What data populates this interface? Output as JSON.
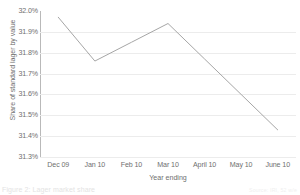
{
  "chart_data": {
    "type": "line",
    "title": "",
    "xlabel": "Year ending",
    "ylabel": "Share of standard lager by value",
    "categories": [
      "Dec 09",
      "Jan 10",
      "Feb 10",
      "Mar 10",
      "April 10",
      "May 10",
      "June 10"
    ],
    "values": [
      31.97,
      31.76,
      31.85,
      31.94,
      31.77,
      31.6,
      31.43
    ],
    "ytick_labels": [
      "32.0%",
      "31.9%",
      "31.8%",
      "31.7%",
      "31.6%",
      "31.5%",
      "31.4%",
      "31.3%"
    ],
    "ytick_values": [
      32.0,
      31.9,
      31.8,
      31.7,
      31.6,
      31.5,
      31.4,
      31.3
    ],
    "ylim": [
      31.3,
      32.0
    ],
    "grid": "horizontal",
    "legend": "none",
    "series": [
      {
        "name": "Share of standard lager by value",
        "values": [
          31.97,
          31.76,
          31.85,
          31.94,
          31.77,
          31.6,
          31.43
        ],
        "color": "#a6a6a6"
      }
    ],
    "line_color": "#a6a6a6",
    "grid_color": "#ececec",
    "axis_color": "#b9b9b9",
    "text_color": "#6f6f6f"
  },
  "caption": {
    "text": "Figure 2: Lager market share",
    "source": "Source: IRI, 52 w/e"
  }
}
